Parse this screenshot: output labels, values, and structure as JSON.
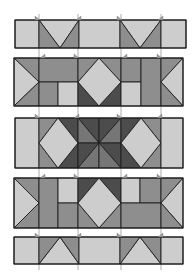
{
  "diagram": {
    "width": 192,
    "height": 280,
    "colors": {
      "light": "#cdcdcd",
      "medium": "#8e8e8e",
      "mediumdark": "#767676",
      "dark": "#4c4c4c",
      "line": "#1e1e1e",
      "background": "#ffffff"
    },
    "guides_x": [
      39,
      78,
      121,
      161
    ],
    "flags": [
      {
        "x": 35,
        "y": 20,
        "dir": "r"
      },
      {
        "x": 76,
        "y": 20,
        "dir": "l"
      },
      {
        "x": 117,
        "y": 20,
        "dir": "r"
      },
      {
        "x": 158,
        "y": 20,
        "dir": "l"
      },
      {
        "x": 40,
        "y": 58,
        "dir": "l"
      },
      {
        "x": 74,
        "y": 58,
        "dir": "r"
      },
      {
        "x": 122,
        "y": 58,
        "dir": "l"
      },
      {
        "x": 157,
        "y": 58,
        "dir": "r"
      },
      {
        "x": 35,
        "y": 118,
        "dir": "r"
      },
      {
        "x": 74,
        "y": 118,
        "dir": "l"
      },
      {
        "x": 117,
        "y": 118,
        "dir": "r"
      },
      {
        "x": 157,
        "y": 118,
        "dir": "l"
      },
      {
        "x": 40,
        "y": 178,
        "dir": "l"
      },
      {
        "x": 74,
        "y": 178,
        "dir": "r"
      },
      {
        "x": 122,
        "y": 178,
        "dir": "l"
      },
      {
        "x": 157,
        "y": 178,
        "dir": "r"
      },
      {
        "x": 35,
        "y": 237,
        "dir": "r"
      },
      {
        "x": 76,
        "y": 237,
        "dir": "l"
      },
      {
        "x": 117,
        "y": 237,
        "dir": "r"
      },
      {
        "x": 158,
        "y": 237,
        "dir": "l"
      }
    ],
    "rows": [
      {
        "name": "row-1-sashing",
        "bounds": [
          15,
          20,
          186,
          48
        ],
        "pieces": [
          {
            "name": "light-rect",
            "color": "light",
            "points": "15,20 39,20 39,48 15,48"
          },
          {
            "name": "v-top-light",
            "color": "light",
            "points": "39,20 79,20 60,48"
          },
          {
            "name": "v-left-dark",
            "color": "medium",
            "points": "39,20 60,48 39,48"
          },
          {
            "name": "v-right-dark",
            "color": "medium",
            "points": "79,20 79,48 60,48"
          },
          {
            "name": "light-rect",
            "color": "light",
            "points": "79,20 120,20 120,48 79,48"
          },
          {
            "name": "v-top-light",
            "color": "light",
            "points": "120,20 161,20 140,48"
          },
          {
            "name": "v-left-dark",
            "color": "medium",
            "points": "120,20 140,48 120,48"
          },
          {
            "name": "v-right-dark",
            "color": "medium",
            "points": "161,20 161,48 140,48"
          },
          {
            "name": "light-rect",
            "color": "light",
            "points": "161,20 186,20 186,48 161,48"
          }
        ]
      },
      {
        "name": "row-2-blocks",
        "bounds": [
          14,
          58,
          183,
          106
        ],
        "pieces": [
          {
            "name": "edge-tri-top",
            "color": "medium",
            "points": "14,58 39,58 39,82"
          },
          {
            "name": "edge-tri-left-light",
            "color": "light",
            "points": "14,58 39,82 14,106"
          },
          {
            "name": "edge-tri-bottom",
            "color": "medium",
            "points": "14,106 39,82 39,106"
          },
          {
            "name": "top-wide-rect",
            "color": "medium",
            "points": "39,58 78,58 78,82 39,82"
          },
          {
            "name": "bottom-left-rect",
            "color": "medium",
            "points": "39,82 58,82 58,106 39,106"
          },
          {
            "name": "bottom-right-light-rect",
            "color": "light",
            "points": "58,82 78,82 78,106 58,106"
          },
          {
            "name": "diamond-tl",
            "color": "medium",
            "points": "78,58 99,58 78,82"
          },
          {
            "name": "diamond-tr",
            "color": "medium",
            "points": "99,58 121,58 121,82"
          },
          {
            "name": "diamond-bl",
            "color": "dark",
            "points": "78,82 78,106 99,106"
          },
          {
            "name": "diamond-br",
            "color": "dark",
            "points": "121,82 121,106 99,106"
          },
          {
            "name": "diamond-center",
            "color": "light",
            "points": "99,58 121,82 99,106 78,82"
          },
          {
            "name": "narrow-rect-top",
            "color": "medium",
            "points": "121,58 141,58 141,82 121,82"
          },
          {
            "name": "narrow-rect-bottom-light",
            "color": "light",
            "points": "121,82 141,82 141,106 121,106"
          },
          {
            "name": "tall-rect",
            "color": "medium",
            "points": "141,58 161,58 161,106 141,106"
          },
          {
            "name": "edge-tri-top-r",
            "color": "medium",
            "points": "161,58 183,58 161,82"
          },
          {
            "name": "edge-tri-right-light",
            "color": "light",
            "points": "183,58 183,106 161,82"
          },
          {
            "name": "edge-tri-bottom-r",
            "color": "medium",
            "points": "161,82 183,106 161,106"
          }
        ]
      },
      {
        "name": "row-3-blocks",
        "bounds": [
          15,
          118,
          183,
          168
        ],
        "pieces": [
          {
            "name": "light-rect",
            "color": "light",
            "points": "15,118 39,118 39,168 15,168"
          },
          {
            "name": "dia-tl",
            "color": "medium",
            "points": "39,118 58,118 39,143"
          },
          {
            "name": "dia-bl",
            "color": "medium",
            "points": "39,143 39,168 58,168"
          },
          {
            "name": "dia-tr",
            "color": "dark",
            "points": "58,118 78,118 78,143"
          },
          {
            "name": "dia-br",
            "color": "dark",
            "points": "78,143 78,168 58,168"
          },
          {
            "name": "dia-center",
            "color": "light",
            "points": "58,118 78,143 58,168 39,143"
          },
          {
            "name": "star-1",
            "color": "dark",
            "points": "78,118 99,118 99,143"
          },
          {
            "name": "star-2",
            "color": "mediumdark",
            "points": "78,118 99,143 78,143"
          },
          {
            "name": "star-3",
            "color": "dark",
            "points": "99,118 121,118 99,143"
          },
          {
            "name": "star-4",
            "color": "mediumdark",
            "points": "121,118 121,143 99,143"
          },
          {
            "name": "star-5",
            "color": "dark",
            "points": "78,143 99,143 78,168"
          },
          {
            "name": "star-6",
            "color": "mediumdark",
            "points": "78,168 99,143 99,168"
          },
          {
            "name": "star-7",
            "color": "dark",
            "points": "99,143 121,143 121,168"
          },
          {
            "name": "star-8",
            "color": "mediumdark",
            "points": "99,143 121,168 99,168"
          },
          {
            "name": "dia-tl",
            "color": "dark",
            "points": "121,118 141,118 121,143"
          },
          {
            "name": "dia-bl",
            "color": "dark",
            "points": "121,143 121,168 141,168"
          },
          {
            "name": "dia-tr",
            "color": "medium",
            "points": "141,118 161,118 161,143"
          },
          {
            "name": "dia-br",
            "color": "medium",
            "points": "161,143 161,168 141,168"
          },
          {
            "name": "dia-center",
            "color": "light",
            "points": "141,118 161,143 141,168 121,143"
          },
          {
            "name": "light-rect",
            "color": "light",
            "points": "161,118 183,118 183,168 161,168"
          }
        ]
      },
      {
        "name": "row-4-blocks",
        "bounds": [
          14,
          178,
          183,
          228
        ],
        "pieces": [
          {
            "name": "edge-tri-top",
            "color": "medium",
            "points": "14,178 39,178 39,203"
          },
          {
            "name": "edge-tri-left-light",
            "color": "light",
            "points": "14,178 39,203 14,228"
          },
          {
            "name": "edge-tri-bottom",
            "color": "medium",
            "points": "14,228 39,203 39,228"
          },
          {
            "name": "tall-rect",
            "color": "medium",
            "points": "39,178 58,178 58,228 39,228"
          },
          {
            "name": "top-light-rect",
            "color": "light",
            "points": "58,178 78,178 78,203 58,203"
          },
          {
            "name": "bottom-rect",
            "color": "medium",
            "points": "58,203 78,203 78,228 58,228"
          },
          {
            "name": "diamond-tl",
            "color": "dark",
            "points": "78,178 99,178 78,203"
          },
          {
            "name": "diamond-tr",
            "color": "dark",
            "points": "99,178 121,178 121,203"
          },
          {
            "name": "diamond-bl",
            "color": "medium",
            "points": "78,203 78,228 99,228"
          },
          {
            "name": "diamond-br",
            "color": "medium",
            "points": "121,203 121,228 99,228"
          },
          {
            "name": "diamond-center",
            "color": "light",
            "points": "99,178 121,203 99,228 78,203"
          },
          {
            "name": "top-light-rect",
            "color": "light",
            "points": "121,178 140,178 140,203 121,203"
          },
          {
            "name": "top-rect",
            "color": "medium",
            "points": "140,178 161,178 161,203 140,203"
          },
          {
            "name": "bottom-wide-rect",
            "color": "medium",
            "points": "121,203 161,203 161,228 121,228"
          },
          {
            "name": "edge-tri-top-r",
            "color": "medium",
            "points": "161,178 183,178 161,203"
          },
          {
            "name": "edge-tri-right-light",
            "color": "light",
            "points": "183,178 183,228 161,203"
          },
          {
            "name": "edge-tri-bottom-r",
            "color": "medium",
            "points": "161,203 183,228 161,228"
          }
        ]
      },
      {
        "name": "row-5-sashing",
        "bounds": [
          14,
          237,
          183,
          264
        ],
        "pieces": [
          {
            "name": "light-rect",
            "color": "light",
            "points": "14,237 39,237 39,264 14,264"
          },
          {
            "name": "a-bottom-light",
            "color": "light",
            "points": "39,264 79,264 60,237"
          },
          {
            "name": "a-left-dark",
            "color": "medium",
            "points": "39,237 60,237 39,264"
          },
          {
            "name": "a-right-dark",
            "color": "medium",
            "points": "60,237 79,237 79,264"
          },
          {
            "name": "light-rect",
            "color": "light",
            "points": "79,237 120,237 120,264 79,264"
          },
          {
            "name": "a-bottom-light",
            "color": "light",
            "points": "120,264 161,264 140,237"
          },
          {
            "name": "a-left-dark",
            "color": "medium",
            "points": "120,237 140,237 120,264"
          },
          {
            "name": "a-right-dark",
            "color": "medium",
            "points": "140,237 161,237 161,264"
          },
          {
            "name": "light-rect",
            "color": "light",
            "points": "161,237 183,237 183,264 161,264"
          }
        ]
      }
    ]
  }
}
